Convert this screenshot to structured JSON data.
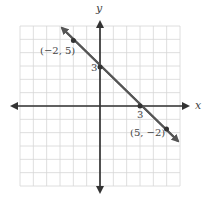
{
  "chart_data": {
    "type": "line",
    "title": "",
    "xlabel": "x",
    "ylabel": "y",
    "xlim": [
      -6,
      6
    ],
    "ylim": [
      -6,
      6
    ],
    "grid": true,
    "line": {
      "equation": "y = -x + 3",
      "slope": -1,
      "intercept": 3,
      "color": "#555555"
    },
    "points": [
      {
        "x": -2,
        "y": 5,
        "label": "(−2, 5)"
      },
      {
        "x": 0,
        "y": 3,
        "label": "3"
      },
      {
        "x": 3,
        "y": 0,
        "label": "3"
      },
      {
        "x": 5,
        "y": -2,
        "label": "(5, −2)"
      }
    ]
  },
  "labels": {
    "x_axis": "x",
    "y_axis": "y",
    "point_a": "(−2, 5)",
    "y_intercept": "3",
    "x_intercept": "3",
    "point_b": "(5, −2)"
  }
}
